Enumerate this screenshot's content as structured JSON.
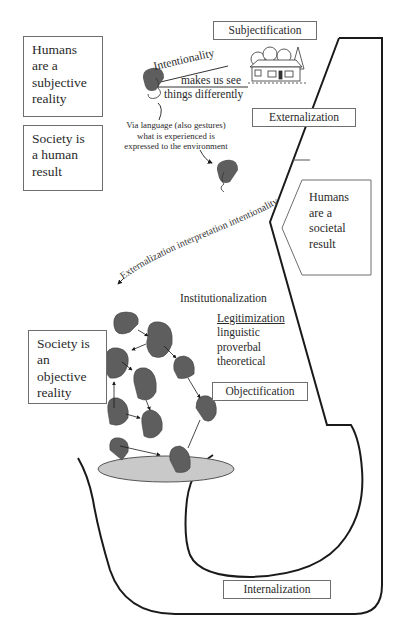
{
  "diagram": {
    "boxes": {
      "humans_subjective": {
        "lines": [
          "Humans",
          "are a",
          "subjective",
          "reality"
        ]
      },
      "society_human_result": {
        "lines": [
          "Society is",
          "a human",
          "result"
        ]
      },
      "humans_societal": {
        "lines": [
          "Humans",
          "are a",
          "societal",
          "result"
        ]
      },
      "society_objective": {
        "lines": [
          "Society is",
          "an objective",
          "reality"
        ]
      }
    },
    "stage_labels": {
      "subjectification": "Subjectification",
      "externalization": "Externalization",
      "objectification": "Objectification",
      "internalization": "Internalization"
    },
    "intentionality": {
      "line1": "Intentionality",
      "line2": "makes us see",
      "line3": "things differently"
    },
    "language_note": {
      "line1": "Via language (also gestures)",
      "line2": "what is experienced is",
      "line3": "expressed to the environment"
    },
    "curved_caption": "Externalization interpretation intentionality",
    "institutionalization": "Institutionalization",
    "legitimization": {
      "title": "Legitimization",
      "items": [
        "linguistic",
        "proverbal",
        "theoretical"
      ]
    },
    "colors": {
      "line": "#1a1a1a",
      "box_border": "#6e6e6e",
      "head_fill": "#5e5e5e",
      "pedestal_fill": "#c9c9c9"
    }
  }
}
